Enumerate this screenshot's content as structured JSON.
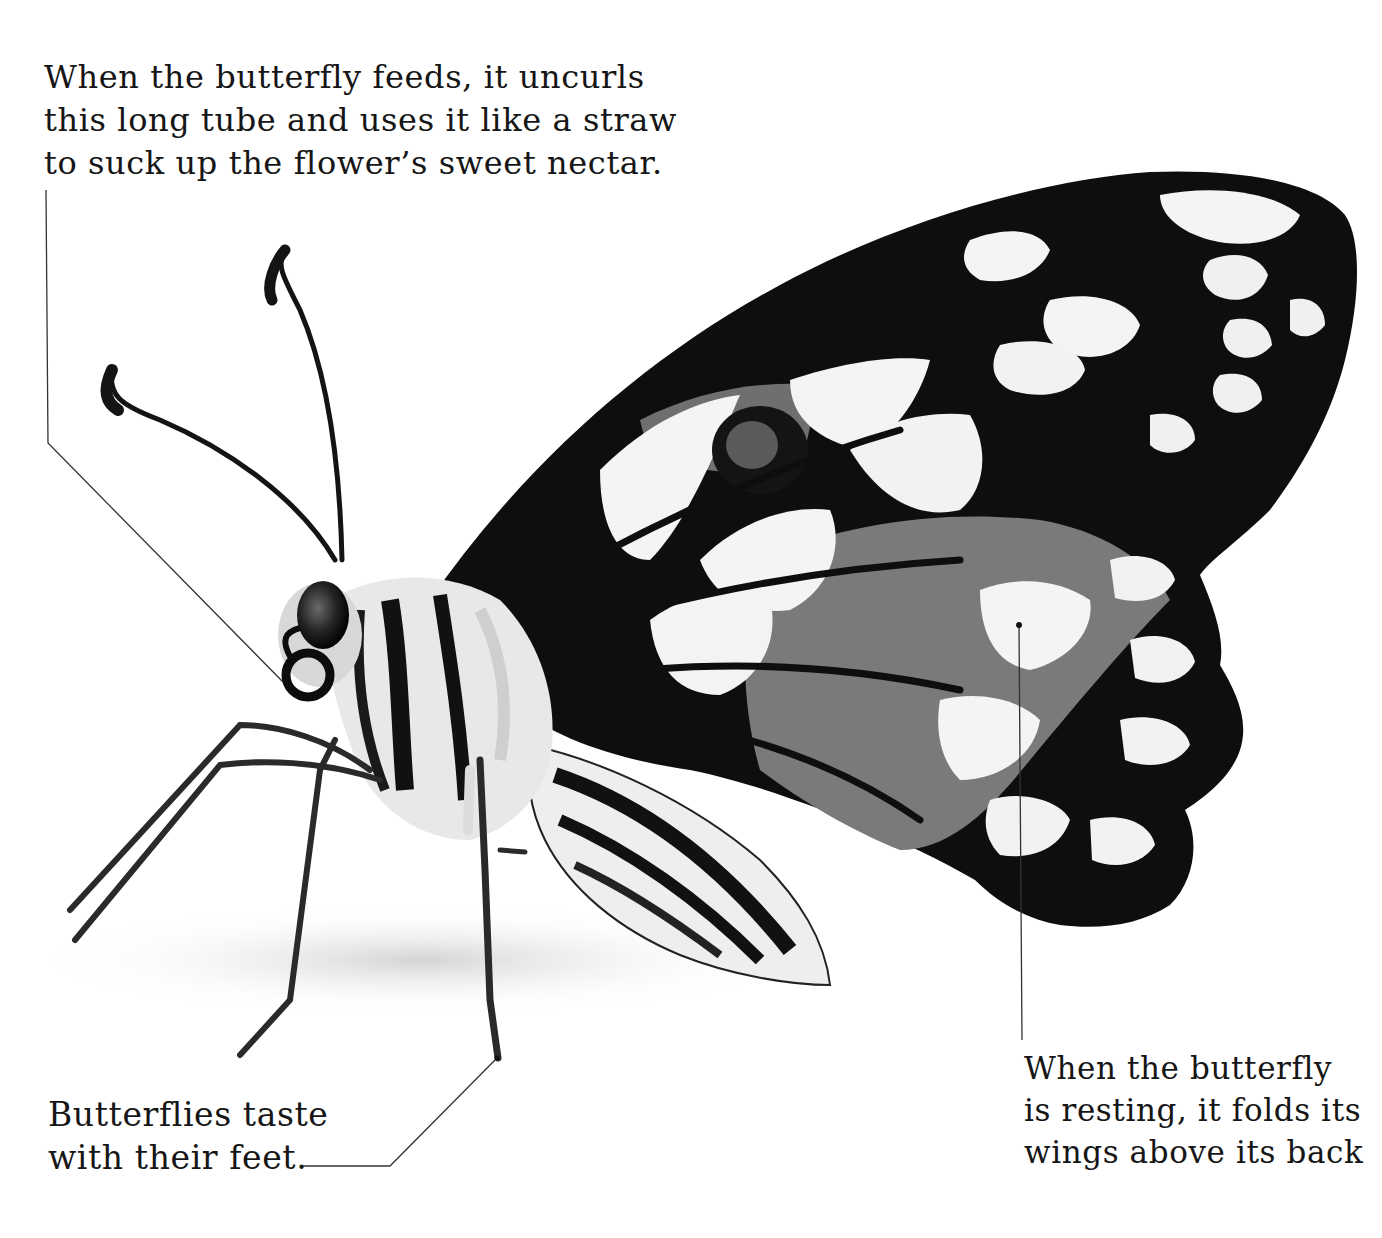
{
  "page": {
    "type": "illustrated book spread"
  },
  "captions": {
    "proboscis": {
      "lines": [
        "When the butterfly feeds, it uncurls",
        "this long tube and uses it like a straw",
        "to suck up the flower’s sweet nectar."
      ]
    },
    "feet": {
      "lines": [
        "Butterflies taste",
        "with their feet."
      ]
    },
    "wings": {
      "lines": [
        "When the butterfly",
        "is resting, it folds its",
        "wings above its back"
      ]
    }
  },
  "colors": {
    "background": "#ffffff",
    "ink": "#161616",
    "wing_black": "#0e0e0e",
    "wing_grey": "#7a7a7a",
    "wing_white": "#f4f4f4",
    "leader_line": "#333333"
  }
}
